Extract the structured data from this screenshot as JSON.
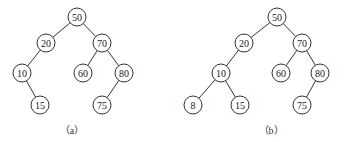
{
  "diagrams": [
    {
      "caption": "（a）",
      "caption_pos": [
        72,
        122
      ],
      "nodes": [
        {
          "id": "50",
          "label": "50",
          "x": 77,
          "y": 17
        },
        {
          "id": "20",
          "label": "20",
          "x": 46,
          "y": 43
        },
        {
          "id": "70",
          "label": "70",
          "x": 102,
          "y": 43
        },
        {
          "id": "10",
          "label": "10",
          "x": 22,
          "y": 73
        },
        {
          "id": "60",
          "label": "60",
          "x": 83,
          "y": 73
        },
        {
          "id": "80",
          "label": "80",
          "x": 124,
          "y": 73
        },
        {
          "id": "15",
          "label": "15",
          "x": 40,
          "y": 105
        },
        {
          "id": "75",
          "label": "75",
          "x": 102,
          "y": 105
        }
      ],
      "edges": [
        [
          "50",
          "20"
        ],
        [
          "50",
          "70"
        ],
        [
          "20",
          "10"
        ],
        [
          "10",
          "15"
        ],
        [
          "70",
          "60"
        ],
        [
          "70",
          "80"
        ],
        [
          "80",
          "75"
        ]
      ]
    },
    {
      "caption": "（b）",
      "caption_pos": [
        271,
        122
      ],
      "nodes": [
        {
          "id": "50",
          "label": "50",
          "x": 277,
          "y": 17
        },
        {
          "id": "20",
          "label": "20",
          "x": 244,
          "y": 43
        },
        {
          "id": "70",
          "label": "70",
          "x": 302,
          "y": 43
        },
        {
          "id": "10",
          "label": "10",
          "x": 221,
          "y": 73
        },
        {
          "id": "60",
          "label": "60",
          "x": 281,
          "y": 73
        },
        {
          "id": "80",
          "label": "80",
          "x": 320,
          "y": 73
        },
        {
          "id": "8",
          "label": "8",
          "x": 193,
          "y": 105
        },
        {
          "id": "15",
          "label": "15",
          "x": 240,
          "y": 105
        },
        {
          "id": "75",
          "label": "75",
          "x": 302,
          "y": 105
        }
      ],
      "edges": [
        [
          "50",
          "20"
        ],
        [
          "50",
          "70"
        ],
        [
          "20",
          "10"
        ],
        [
          "10",
          "8"
        ],
        [
          "10",
          "15"
        ],
        [
          "70",
          "60"
        ],
        [
          "70",
          "80"
        ],
        [
          "80",
          "75"
        ]
      ]
    }
  ],
  "node_radius": 9
}
